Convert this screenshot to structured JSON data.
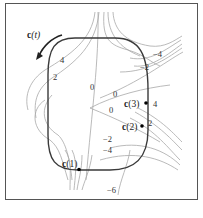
{
  "figure": {
    "curve_label_bold": "c",
    "curve_label_rest": "(t)",
    "points": [
      {
        "name": "c(1)",
        "bold": "c",
        "rest": "(1)"
      },
      {
        "name": "c(2)",
        "bold": "c",
        "rest": "(2)"
      },
      {
        "name": "c(3)",
        "bold": "c",
        "rest": "(3)"
      }
    ],
    "level_labels": {
      "top_left_4": "4",
      "top_left_2": "2",
      "center_0_a": "0",
      "center_0_b": "0",
      "center_0_c": "0",
      "right_0": "0",
      "top_right_neg4": "−4",
      "top_right_neg2": "−2",
      "right_4": "4",
      "right_2": "2",
      "lower_neg2": "−2",
      "lower_neg4": "−4",
      "bottom_neg6": "−6"
    },
    "colors": {
      "curve": "#3a3a3a",
      "level_curves": "#a8a8a8",
      "frame": "#555555"
    }
  }
}
